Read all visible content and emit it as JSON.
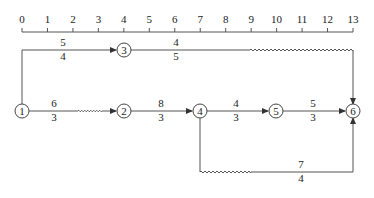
{
  "axis": {
    "ticks": [
      "0",
      "1",
      "2",
      "3",
      "4",
      "5",
      "6",
      "7",
      "8",
      "9",
      "10",
      "11",
      "12",
      "13"
    ]
  },
  "nodes": [
    {
      "id": "1",
      "label": "1"
    },
    {
      "id": "2",
      "label": "2"
    },
    {
      "id": "3",
      "label": "3"
    },
    {
      "id": "4",
      "label": "4"
    },
    {
      "id": "5",
      "label": "5"
    },
    {
      "id": "6",
      "label": "6"
    }
  ],
  "edges": [
    {
      "from": "1",
      "to": "3",
      "top": "5",
      "bottom": "4"
    },
    {
      "from": "3",
      "to": "6",
      "top": "4",
      "bottom": "5"
    },
    {
      "from": "1",
      "to": "2",
      "top": "6",
      "bottom": "3"
    },
    {
      "from": "2",
      "to": "4",
      "top": "8",
      "bottom": "3"
    },
    {
      "from": "4",
      "to": "5",
      "top": "4",
      "bottom": "3"
    },
    {
      "from": "5",
      "to": "6",
      "top": "5",
      "bottom": "3"
    },
    {
      "from": "4",
      "to": "6",
      "top": "7",
      "bottom": "4"
    }
  ],
  "colors": {
    "line": "#555555",
    "text": "#222222"
  }
}
